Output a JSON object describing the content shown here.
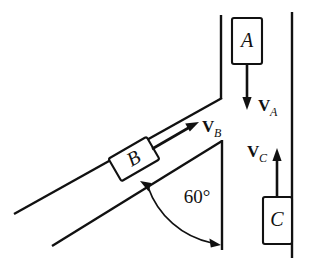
{
  "figure": {
    "kind": "physics-free-body-diagram",
    "background_color": "#ffffff",
    "ink_color": "#111111",
    "width": 318,
    "height": 267
  },
  "blocks": [
    {
      "id": "A",
      "label": "A",
      "name": "block-a",
      "x": 232,
      "y": 18,
      "width": 30,
      "height": 46,
      "rotation": 0
    },
    {
      "id": "B",
      "label": "B",
      "name": "block-b",
      "x": 112,
      "y": 146,
      "width": 44,
      "height": 26,
      "rotation": -30
    },
    {
      "id": "C",
      "label": "C",
      "name": "block-c",
      "x": 263,
      "y": 197,
      "width": 29,
      "height": 47,
      "rotation": 0
    }
  ],
  "vectors": [
    {
      "id": "VA",
      "main": "V",
      "subscript": "A",
      "name": "velocity-vector-a",
      "direction": "down",
      "label_x": 258,
      "label_y": 106,
      "sub_x": 271,
      "sub_y": 111
    },
    {
      "id": "VB",
      "main": "V",
      "subscript": "B",
      "name": "velocity-vector-b",
      "direction": "up-right-30",
      "label_x": 205,
      "label_y": 128,
      "sub_x": 218,
      "sub_y": 133
    },
    {
      "id": "VC",
      "main": "V",
      "subscript": "C",
      "name": "velocity-vector-c",
      "direction": "up",
      "label_x": 247,
      "label_y": 151,
      "sub_x": 260,
      "sub_y": 156
    }
  ],
  "angle": {
    "value": "60",
    "unit": "°",
    "text": "60°",
    "name": "incline-angle-label",
    "label_x": 197,
    "label_y": 203
  },
  "walls": [
    {
      "name": "vertical-wall-left-upper",
      "x1": 221,
      "y1": 15,
      "x2": 221,
      "y2": 98
    },
    {
      "name": "incline-wall-upper",
      "x1": 221,
      "y1": 98,
      "x2": 14,
      "y2": 214
    },
    {
      "name": "vertical-wall-inner-lower",
      "x1": 222,
      "y1": 140,
      "x2": 222,
      "y2": 250
    },
    {
      "name": "incline-wall-lower",
      "x1": 222,
      "y1": 140,
      "x2": 52,
      "y2": 246
    },
    {
      "name": "vertical-wall-right-outer",
      "x1": 292,
      "y1": 12,
      "x2": 292,
      "y2": 258
    }
  ]
}
